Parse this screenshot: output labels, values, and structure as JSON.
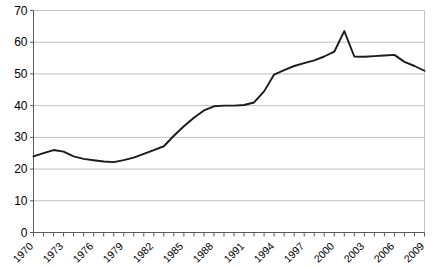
{
  "chart_data": {
    "type": "line",
    "title": "",
    "subtitle": "",
    "xlabel": "",
    "ylabel": "",
    "xlim": [
      1970,
      2009
    ],
    "ylim": [
      0,
      70
    ],
    "ytick_step": 10,
    "yticks": [
      0,
      10,
      20,
      30,
      40,
      50,
      60,
      70
    ],
    "ytick_labels": [
      "0",
      "10",
      "20",
      "30",
      "40",
      "50",
      "60",
      "70"
    ],
    "xtick_labels": [
      "1970",
      "1973",
      "1976",
      "1979",
      "1982",
      "1985",
      "1988",
      "1991",
      "1994",
      "1997",
      "2000",
      "2003",
      "2006",
      "2009"
    ],
    "xtick_label_years": [
      1970,
      1973,
      1976,
      1979,
      1982,
      1985,
      1988,
      1991,
      1994,
      1997,
      2000,
      2003,
      2006,
      2009
    ],
    "xtick_label_rotation": -45,
    "minor_tick_years": [
      1970,
      1971,
      1972,
      1973,
      1974,
      1975,
      1976,
      1977,
      1978,
      1979,
      1980,
      1981,
      1982,
      1983,
      1984,
      1985,
      1986,
      1987,
      1988,
      1989,
      1990,
      1991,
      1992,
      1993,
      1994,
      1995,
      1996,
      1997,
      1998,
      1999,
      2000,
      2001,
      2002,
      2003,
      2004,
      2005,
      2006,
      2007,
      2008,
      2009
    ],
    "grid": "horizontal",
    "legend": "none",
    "line_color": "#1a1a1a",
    "grid_color": "#bfbfbf",
    "axis_color": "#808080",
    "background_color": "#ffffff",
    "x": [
      1970,
      1971,
      1972,
      1973,
      1974,
      1975,
      1976,
      1977,
      1978,
      1979,
      1980,
      1981,
      1982,
      1983,
      1984,
      1985,
      1986,
      1987,
      1988,
      1989,
      1990,
      1991,
      1992,
      1993,
      1994,
      1995,
      1996,
      1997,
      1998,
      1999,
      2000,
      2001,
      2002,
      2003,
      2004,
      2005,
      2006,
      2007,
      2008,
      2009
    ],
    "values": [
      24.0,
      25.0,
      26.0,
      25.5,
      24.0,
      23.2,
      22.8,
      22.4,
      22.2,
      22.8,
      23.6,
      24.8,
      26.0,
      27.2,
      30.5,
      33.5,
      36.2,
      38.5,
      39.8,
      40.0,
      40.0,
      40.2,
      41.0,
      44.5,
      49.8,
      51.2,
      52.5,
      53.4,
      54.3,
      55.5,
      57.0,
      63.5,
      55.5,
      55.4,
      55.6,
      55.8,
      56.0,
      53.8,
      52.5,
      51.0
    ],
    "series": [
      {
        "name": "",
        "values": [
          24.0,
          25.0,
          26.0,
          25.5,
          24.0,
          23.2,
          22.8,
          22.4,
          22.2,
          22.8,
          23.6,
          24.8,
          26.0,
          27.2,
          30.5,
          33.5,
          36.2,
          38.5,
          39.8,
          40.0,
          40.0,
          40.2,
          41.0,
          44.5,
          49.8,
          51.2,
          52.5,
          53.4,
          54.3,
          55.5,
          57.0,
          63.5,
          55.5,
          55.4,
          55.6,
          55.8,
          56.0,
          53.8,
          52.5,
          51.0
        ]
      }
    ],
    "annotations": []
  }
}
